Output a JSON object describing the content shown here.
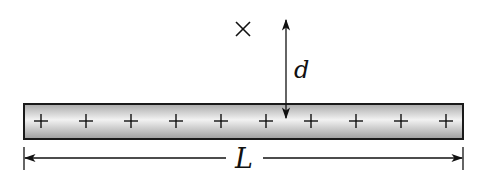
{
  "diagram": {
    "rod": {
      "charge_symbol": "+",
      "charge_count": 10,
      "gradient": {
        "edge": "#a9a9a9",
        "center": "#f2f2f2"
      },
      "stroke": "#1a1a1a"
    },
    "labels": {
      "length": "L",
      "distance": "d",
      "point_marker": "×"
    }
  }
}
